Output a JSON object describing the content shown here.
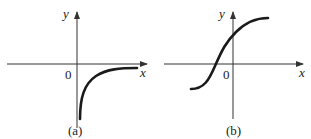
{
  "panels": [
    {
      "id": "a",
      "caption": "(a)",
      "x_label": "x",
      "y_label": "y",
      "origin_label": "0",
      "curve": "increasing concave curve in fourth quadrant approaching x-axis from below (asymptote y=0), vertical asymptote at x=0"
    },
    {
      "id": "b",
      "caption": "(b)",
      "x_label": "x",
      "y_label": "y",
      "origin_label": "0",
      "curve": "increasing S-shaped (sigmoid-like) curve crossing x-axis left of origin"
    }
  ],
  "colors": {
    "axis": "#333333",
    "curve": "#1a1a1a"
  }
}
